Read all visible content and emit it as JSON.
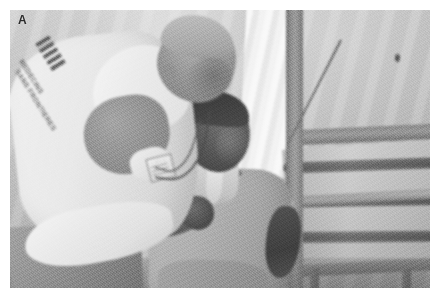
{
  "figure": {
    "panel_label": "A",
    "type": "photograph",
    "rendering": "grayscale",
    "caption_text": "",
    "scene_description": "Clinician in a white organization-logo shirt leaning over to examine a seated patient inside a field hospital tent",
    "frame": {
      "margin_color": "#ffffff",
      "photo_left": 10,
      "photo_top": 10,
      "photo_width": 420,
      "photo_height": 278
    }
  },
  "palette": {
    "background": "#ffffff",
    "photo_base": "#a8a8a6",
    "tent_light": "#d9d9d6",
    "tent_mid": "#bcbcb8",
    "pole_dark": "#6f6f6c",
    "stripe_dark": "#55554f",
    "shirt_white": "#f6f6f3",
    "skin_dark": "#4f483f",
    "label_color": "#2b2b2b"
  },
  "subjects": {
    "clinician": {
      "name": "clinician",
      "garment": "white short-sleeved logo shirt",
      "posture": "standing, bent forward over the patient",
      "accessories": [
        "stethoscope",
        "identification badge"
      ],
      "shirt_logo": {
        "bars": "diagonal stripe mark",
        "line_1": "MEDECINS",
        "line_2": "SANS FRONTIERES"
      }
    },
    "patient": {
      "name": "patient",
      "garment": "grey collared sweater",
      "posture": "seated on a chair, forearm raised",
      "position": "center of frame"
    }
  },
  "scene_elements": {
    "tent_wall": "white canvas tent fabric with soft vertical folds",
    "curtain": "white hanging curtain panel left of the upright pole",
    "frame_poles": [
      "vertical upright pole",
      "upper horizontal cross pole",
      "lower horizontal cross pole"
    ],
    "thin_rod": "slender diagonal rod in the upper right",
    "bed": "striped mattress on a metal bed frame at right",
    "mattress_stripes": 3,
    "chair": "chair with armrest supporting the patient",
    "floor": "shadowed ground along the lower edge"
  }
}
